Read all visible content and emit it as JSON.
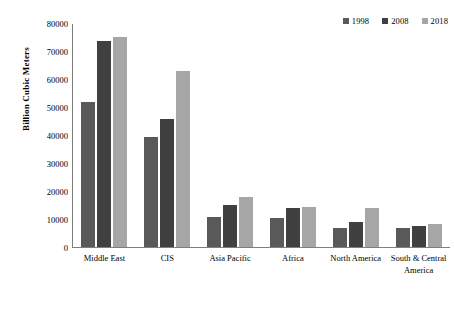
{
  "chart_data": {
    "type": "bar",
    "title": "",
    "subtitle": "",
    "xlabel": "",
    "ylabel": "Billion Cubic Meters",
    "ylim": [
      0,
      80000
    ],
    "ytick_step": 10000,
    "yticks": [
      0,
      10000,
      20000,
      30000,
      40000,
      50000,
      60000,
      70000,
      80000
    ],
    "ytick_labels": [
      "0",
      "10000",
      "20000",
      "30000",
      "40000",
      "50000",
      "60000",
      "70000",
      "80000"
    ],
    "grid": false,
    "legend_position": "top-right",
    "categories": [
      "Middle East",
      "CIS",
      "Asia Pacific",
      "Africa",
      "North America",
      "South & Central America"
    ],
    "series": [
      {
        "name": "1998",
        "color": "#595959",
        "values": [
          52000,
          39500,
          10700,
          10500,
          7000,
          7000
        ]
      },
      {
        "name": "2008",
        "color": "#404040",
        "values": [
          74000,
          46000,
          15000,
          14000,
          8800,
          7700
        ]
      },
      {
        "name": "2018",
        "color": "#a6a6a6",
        "values": [
          75500,
          63000,
          18000,
          14500,
          14000,
          8400
        ]
      }
    ]
  }
}
